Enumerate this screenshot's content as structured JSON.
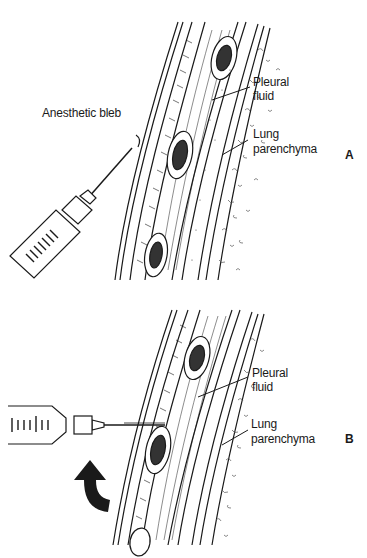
{
  "figure": {
    "panels": [
      {
        "id": "A",
        "letter": "A",
        "labels": {
          "bleb": "Anesthetic bleb",
          "pleural_1": "Pleural",
          "pleural_2": "fluid",
          "lung_1": "Lung",
          "lung_2": "parenchyma"
        },
        "icons": [
          "syringe-icon"
        ]
      },
      {
        "id": "B",
        "letter": "B",
        "labels": {
          "pleural_1": "Pleural",
          "pleural_2": "fluid",
          "lung_1": "Lung",
          "lung_2": "parenchyma"
        },
        "icons": [
          "syringe-icon",
          "curved-arrow-icon"
        ]
      }
    ],
    "colors": {
      "ink": "#1a1a1a",
      "background": "#ffffff"
    }
  }
}
